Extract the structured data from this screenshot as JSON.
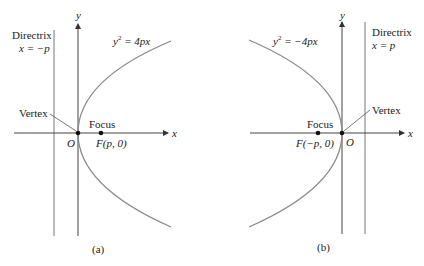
{
  "panels": [
    {
      "id": "a",
      "caption": "(a)",
      "equation": {
        "lhs": "y",
        "sup": "2",
        "rhs": " = 4px"
      },
      "directrix": {
        "title": "Directrix",
        "eq": "x = −p"
      },
      "vertex_label": "Vertex",
      "focus_label": "Focus",
      "focus_coord": "F(p, 0)",
      "origin_label": "O",
      "x_axis_label": "x",
      "y_axis_label": "y"
    },
    {
      "id": "b",
      "caption": "(b)",
      "equation": {
        "lhs": "y",
        "sup": "2",
        "rhs": " = −4px"
      },
      "directrix": {
        "title": "Directrix",
        "eq": "x = p"
      },
      "vertex_label": "Vertex",
      "focus_label": "Focus",
      "focus_coord": "F(−p, 0)",
      "origin_label": "O",
      "x_axis_label": "x",
      "y_axis_label": "y"
    }
  ],
  "colors": {
    "curve": "#8a8a8a",
    "axis": "#444444",
    "directrix": "#777777",
    "text": "#222222"
  }
}
